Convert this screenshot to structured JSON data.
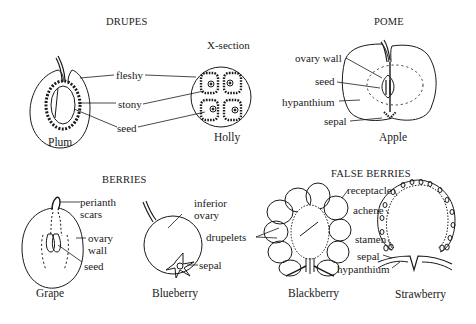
{
  "sections": {
    "drupes": {
      "heading": "DRUPES",
      "xsection_label": "X-section",
      "specimens": [
        "Plum",
        "Holly"
      ],
      "labels": {
        "fleshy": "fleshy",
        "stony": "stony",
        "seed": "seed"
      }
    },
    "pome": {
      "heading": "POME",
      "specimen": "Apple",
      "labels": {
        "ovary_wall": "ovary wall",
        "seed": "seed",
        "hypanthium": "hypanthium",
        "sepal": "sepal"
      }
    },
    "berries": {
      "heading": "BERRIES",
      "specimens": [
        "Grape",
        "Blueberry"
      ],
      "labels": {
        "perianth": "perianth",
        "scars": "scars",
        "ovary": "ovary",
        "wall": "wall",
        "seed": "seed",
        "inferior": "inferior",
        "inferior_ovary": "ovary",
        "sepal": "sepal"
      }
    },
    "false_berries": {
      "heading": "FALSE BERRIES",
      "specimens": [
        "Blackberry",
        "Strawberry"
      ],
      "labels": {
        "drupelets": "drupelets",
        "receptacle": "receptacle",
        "achene": "achene",
        "stamen": "stamen",
        "sepal": "sepal",
        "hypanthium": "hypanthium"
      }
    }
  }
}
